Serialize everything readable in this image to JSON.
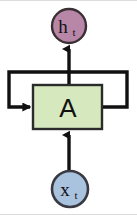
{
  "diagram": {
    "type": "rnn-cell",
    "output_node": {
      "label": "h",
      "subscript": "t",
      "full_text": "h_t",
      "shape": "circle",
      "fill": "#b887a8",
      "stroke": "#3a3033",
      "cx": 69,
      "cy": 25,
      "r": 17
    },
    "cell": {
      "label": "A",
      "shape": "rectangle",
      "fill": "#d6e8bd",
      "stroke": "#2b2b2b",
      "x": 33,
      "y": 84,
      "width": 69,
      "height": 44
    },
    "input_node": {
      "label": "x",
      "subscript": "t",
      "full_text": "x_t",
      "shape": "circle",
      "fill": "#a9c2dd",
      "stroke": "#3a3a42",
      "cx": 70,
      "cy": 188,
      "r": 18
    },
    "edges": [
      {
        "name": "input-to-cell",
        "from": "x_t",
        "to": "A",
        "direction": "up",
        "arrowhead": true,
        "stroke": "#111111"
      },
      {
        "name": "cell-to-output",
        "from": "A",
        "to": "h_t",
        "direction": "up",
        "arrowhead": true,
        "stroke": "#111111"
      },
      {
        "name": "recurrent-self-loop",
        "from": "A",
        "to": "A",
        "direction": "right-up-left-down-right",
        "arrowhead": true,
        "stroke": "#111111"
      }
    ],
    "colors": {
      "background": "#ffffff",
      "line": "#111111",
      "output_fill": "#b887a8",
      "cell_fill": "#d6e8bd",
      "input_fill": "#a9c2dd",
      "frame": "#dcdcdc"
    }
  }
}
